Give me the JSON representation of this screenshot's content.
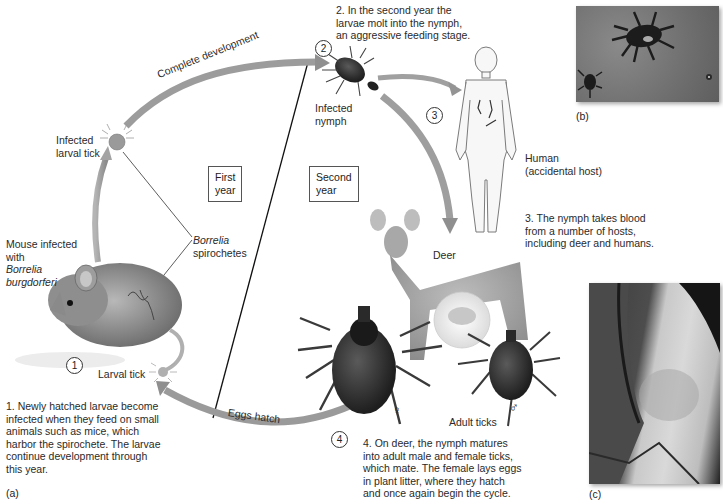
{
  "figure": {
    "panel_labels": {
      "a": "(a)",
      "b": "(b)",
      "c": "(c)"
    },
    "steps": {
      "1": {
        "number": "1",
        "text": "1. Newly hatched larvae become infected when they feed on small animals such as mice, which harbor the spirochete. The larvae continue development through this year."
      },
      "2": {
        "number": "2",
        "text": "2. In the second year the larvae molt into the nymph, an aggressive feeding stage."
      },
      "3": {
        "number": "3",
        "text": "3. The nymph takes blood from a number of hosts, including deer and humans."
      },
      "4": {
        "number": "4",
        "text": "4. On deer, the nymph matures into adult male and female ticks, which mate. The female lays eggs in plant litter, where they hatch and once again begin the cycle."
      }
    },
    "step_text_lines": {
      "1": [
        "1. Newly hatched larvae become",
        "infected when they feed on small",
        "animals such as mice, which",
        "harbor the spirochete. The larvae",
        "continue development through",
        "this year."
      ],
      "2": [
        "2. In the second year the",
        "larvae molt into the nymph,",
        "an aggressive feeding stage."
      ],
      "3": [
        "3. The nymph takes blood",
        "from a number of hosts,",
        "including deer and humans."
      ],
      "4": [
        "4. On deer, the nymph matures",
        "into adult male and female ticks,",
        "which mate. The female lays eggs",
        "in plant litter, where they hatch",
        "and once again begin the cycle."
      ]
    },
    "labels": {
      "mouse_line1": "Mouse infected",
      "mouse_line2": "with",
      "mouse_species1": "Borrelia",
      "mouse_species2": "burgdorferi",
      "infected_larval_tick_1": "Infected",
      "infected_larval_tick_2": "larval tick",
      "infected_nymph_1": "Infected",
      "infected_nymph_2": "nymph",
      "human_1": "Human",
      "human_2": "(accidental host)",
      "deer": "Deer",
      "borrelia_1": "Borrelia",
      "borrelia_2": "spirochetes",
      "larval_tick": "Larval tick",
      "adult_ticks": "Adult ticks",
      "female_symbol": "♀",
      "male_symbol": "♂"
    },
    "year_boxes": {
      "first": [
        "First",
        "year"
      ],
      "second": [
        "Second",
        "year"
      ]
    },
    "arrows": {
      "complete_development": "Complete development",
      "eggs_hatch": "Eggs hatch"
    },
    "colors": {
      "arrow": "#9a9a9a",
      "arrow_dark": "#7d7d7d",
      "line": "#111111",
      "text": "#2a2a2a"
    }
  }
}
